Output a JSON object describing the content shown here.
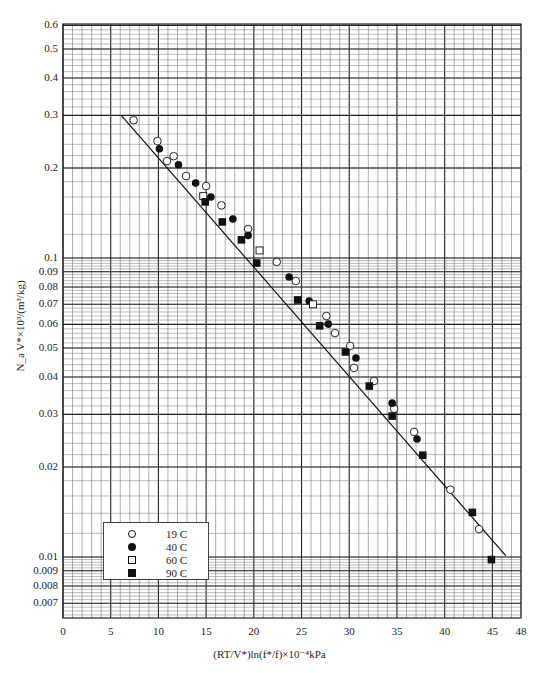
{
  "chart_data": {
    "type": "scatter",
    "title": "",
    "xlabel": "(RT/V*)ln(f*/f)×10⁻⁴kPa",
    "ylabel": "N_a V*×10³/(m³/kg)",
    "xlim": [
      0,
      48
    ],
    "ylim": [
      0.0062,
      0.6
    ],
    "yscale": "log",
    "grid": true,
    "legend_position": "lower left",
    "x_ticks": [
      "0",
      "5",
      "10",
      "15",
      "20",
      "25",
      "30",
      "35",
      "40",
      "45",
      "48"
    ],
    "x_tick_values": [
      0,
      5,
      10,
      15,
      20,
      25,
      30,
      35,
      40,
      45,
      48
    ],
    "y_ticks": [
      "0.6",
      "0.5",
      "0.4",
      "0.3",
      "0.2",
      "0.1",
      "0.09",
      "0.08",
      "0.07",
      "0.06",
      "0.05",
      "0.04",
      "0.03",
      "0.02",
      "0.01",
      "0.009",
      "0.008",
      "0.007"
    ],
    "y_tick_values": [
      0.6,
      0.5,
      0.4,
      0.3,
      0.2,
      0.1,
      0.09,
      0.08,
      0.07,
      0.06,
      0.05,
      0.04,
      0.03,
      0.02,
      0.01,
      0.009,
      0.008,
      0.007
    ],
    "series": [
      {
        "name": "19 C",
        "marker": "open-circle",
        "x": [
          7.4,
          9.9,
          11.6,
          10.9,
          12.9,
          15.0,
          16.6,
          19.4,
          22.4,
          24.4,
          27.6,
          28.5,
          30.1,
          30.5,
          32.6,
          34.7,
          36.8,
          40.6,
          43.6
        ],
        "y": [
          0.289,
          0.246,
          0.219,
          0.211,
          0.188,
          0.174,
          0.15,
          0.125,
          0.097,
          0.0838,
          0.064,
          0.0561,
          0.0508,
          0.0429,
          0.0388,
          0.0313,
          0.0262,
          0.0168,
          0.0124
        ]
      },
      {
        "name": "40 C",
        "marker": "filled-circle",
        "x": [
          10.1,
          12.1,
          13.9,
          15.5,
          17.8,
          19.4,
          23.7,
          25.8,
          27.8,
          30.7,
          34.5,
          37.1
        ],
        "y": [
          0.232,
          0.205,
          0.178,
          0.16,
          0.135,
          0.119,
          0.0864,
          0.0718,
          0.0601,
          0.0463,
          0.0327,
          0.0248
        ]
      },
      {
        "name": "60 C",
        "marker": "open-square",
        "x": [
          14.7,
          20.6,
          26.2
        ],
        "y": [
          0.161,
          0.106,
          0.07
        ]
      },
      {
        "name": "90 C",
        "marker": "filled-square",
        "x": [
          14.9,
          16.7,
          18.7,
          20.3,
          24.6,
          26.9,
          29.6,
          32.1,
          34.5,
          37.7,
          42.9,
          44.9
        ],
        "y": [
          0.154,
          0.132,
          0.115,
          0.0962,
          0.0724,
          0.0593,
          0.0485,
          0.0373,
          0.0296,
          0.0219,
          0.0141,
          0.0098
        ]
      }
    ],
    "fit_line": {
      "x": [
        6.1,
        46.4
      ],
      "y": [
        0.3,
        0.0101
      ]
    }
  },
  "legend": {
    "items": [
      {
        "label": "19 C",
        "marker": "open-circle"
      },
      {
        "label": "40 C",
        "marker": "filled-circle"
      },
      {
        "label": "60 C",
        "marker": "open-square"
      },
      {
        "label": "90 C",
        "marker": "filled-square"
      }
    ]
  },
  "colors": {
    "grid_major": "#222222",
    "grid_minor": "#777777",
    "marker": "#111111"
  }
}
